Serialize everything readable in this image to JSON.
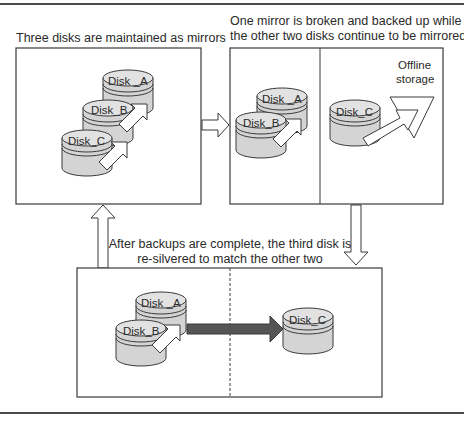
{
  "diagram": {
    "stages": [
      {
        "id": "stage1",
        "caption": "Three disks are maintained as mirrors",
        "disks": [
          "Disk _A",
          "Disk_B",
          "Disk_C"
        ]
      },
      {
        "id": "stage2",
        "caption_line1": "One mirror is broken and backed up while",
        "caption_line2": "the other two disks continue to be mirrored",
        "left_disks": [
          "Disk _A",
          "Disk_B"
        ],
        "right_disk": "Disk_C",
        "offline_label_line1": "Offline",
        "offline_label_line2": "storage"
      },
      {
        "id": "stage3",
        "caption_line1": "After backups are complete, the third disk is",
        "caption_line2": "re-silvered to match the other two",
        "left_disks": [
          "Disk _A",
          "Disk_B"
        ],
        "right_disk": "Disk_C"
      }
    ],
    "colors": {
      "disk_fill": "#d4d4d4",
      "disk_top": "#e2e2e2",
      "outline": "#3a3a3a",
      "resilver_arrow": "#555555"
    }
  }
}
